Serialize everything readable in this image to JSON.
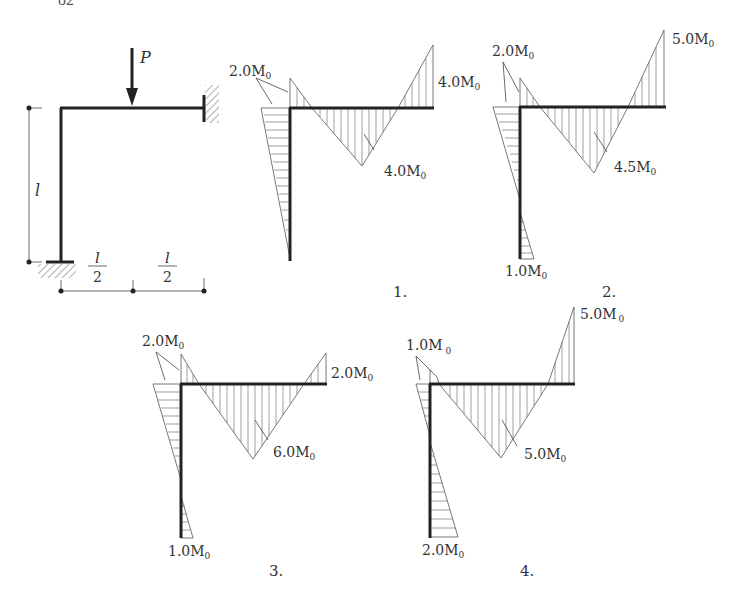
{
  "page_number": "82",
  "problem": {
    "load_label": "P",
    "column_height_label": "l",
    "span_labels": [
      {
        "num": "l",
        "den": "2"
      },
      {
        "num": "l",
        "den": "2"
      }
    ]
  },
  "options": [
    {
      "number": "1.",
      "corner_column_value": "2.0M",
      "corner_beam_value": "2.0M",
      "shared_corner_label": "2.0M",
      "midspan_label": "4.0M",
      "right_end_label": "4.0M",
      "column_base_label": ""
    },
    {
      "number": "2.",
      "shared_corner_label": "2.0M",
      "midspan_label": "4.5M",
      "right_end_label": "5.0M",
      "column_base_label": "1.0M"
    },
    {
      "number": "3.",
      "shared_corner_label": "2.0M",
      "midspan_label": "6.0M",
      "right_end_label": "2.0M",
      "column_base_label": "1.0M"
    },
    {
      "number": "4.",
      "shared_corner_label": "1.0M",
      "midspan_label": "5.0M",
      "right_end_label": "5.0M",
      "column_base_label": "2.0M"
    }
  ],
  "subscript": "0"
}
